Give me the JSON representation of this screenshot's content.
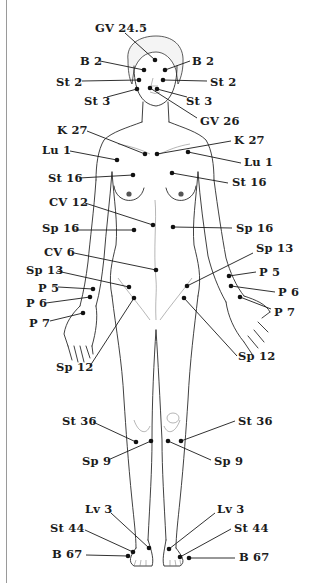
{
  "diagram": {
    "type": "acupressure-points-front-body",
    "ink_color": "#1c1c1c",
    "background": "#ffffff",
    "points": [
      {
        "id": "gv24_5",
        "label": "GV 24.5",
        "lx": 95,
        "ly": 22,
        "dot": [
          155,
          60
        ],
        "line_from": [
          125,
          33
        ]
      },
      {
        "id": "b2_l",
        "label": "B 2",
        "lx": 80,
        "ly": 55,
        "dot": [
          144,
          70
        ],
        "line_from": [
          100,
          61
        ]
      },
      {
        "id": "b2_r",
        "label": "B 2",
        "lx": 192,
        "ly": 55,
        "dot": [
          165,
          70
        ],
        "line_from": [
          190,
          61
        ]
      },
      {
        "id": "st2_l",
        "label": "St 2",
        "lx": 56,
        "ly": 76,
        "dot": [
          139,
          80
        ],
        "line_from": [
          82,
          81
        ]
      },
      {
        "id": "st2_r",
        "label": "St 2",
        "lx": 210,
        "ly": 76,
        "dot": [
          163,
          80
        ],
        "line_from": [
          207,
          81
        ]
      },
      {
        "id": "st3_l",
        "label": "St 3",
        "lx": 84,
        "ly": 95,
        "dot": [
          137,
          89
        ],
        "line_from": [
          107,
          97
        ]
      },
      {
        "id": "st3_r",
        "label": "St 3",
        "lx": 186,
        "ly": 95,
        "dot": [
          157,
          89
        ],
        "line_from": [
          187,
          97
        ]
      },
      {
        "id": "gv26",
        "label": "GV 26",
        "lx": 200,
        "ly": 115,
        "dot": [
          150,
          88
        ],
        "line_from": [
          197,
          118
        ]
      },
      {
        "id": "k27_l",
        "label": "K 27",
        "lx": 57,
        "ly": 124,
        "dot": [
          145,
          154
        ],
        "line_from": [
          87,
          131
        ]
      },
      {
        "id": "k27_r",
        "label": "K 27",
        "lx": 234,
        "ly": 134,
        "dot": [
          157,
          154
        ],
        "line_from": [
          231,
          141
        ]
      },
      {
        "id": "lu1_l",
        "label": "Lu 1",
        "lx": 42,
        "ly": 144,
        "dot": [
          117,
          160
        ],
        "line_from": [
          70,
          151
        ]
      },
      {
        "id": "lu1_r",
        "label": "Lu 1",
        "lx": 244,
        "ly": 156,
        "dot": [
          188,
          152
        ],
        "line_from": [
          241,
          163
        ]
      },
      {
        "id": "st16_l",
        "label": "St 16",
        "lx": 48,
        "ly": 172,
        "dot": [
          133,
          175
        ],
        "line_from": [
          79,
          178
        ]
      },
      {
        "id": "st16_r",
        "label": "St 16",
        "lx": 232,
        "ly": 176,
        "dot": [
          172,
          173
        ],
        "line_from": [
          228,
          183
        ]
      },
      {
        "id": "cv12",
        "label": "CV 12",
        "lx": 49,
        "ly": 196,
        "dot": [
          153,
          225
        ],
        "line_from": [
          85,
          203
        ]
      },
      {
        "id": "sp16_l",
        "label": "Sp 16",
        "lx": 42,
        "ly": 222,
        "dot": [
          134,
          230
        ],
        "line_from": [
          73,
          230
        ]
      },
      {
        "id": "sp16_r",
        "label": "Sp 16",
        "lx": 236,
        "ly": 222,
        "dot": [
          173,
          227
        ],
        "line_from": [
          232,
          228
        ]
      },
      {
        "id": "cv6",
        "label": "CV 6",
        "lx": 44,
        "ly": 246,
        "dot": [
          156,
          270
        ],
        "line_from": [
          74,
          253
        ]
      },
      {
        "id": "sp13_l",
        "label": "Sp 13",
        "lx": 26,
        "ly": 264,
        "dot": [
          129,
          287
        ],
        "line_from": [
          57,
          271
        ]
      },
      {
        "id": "sp13_r",
        "label": "Sp 13",
        "lx": 256,
        "ly": 242,
        "dot": [
          187,
          286
        ],
        "line_from": [
          253,
          253
        ]
      },
      {
        "id": "p5_l",
        "label": "P 5",
        "lx": 38,
        "ly": 282,
        "dot": [
          93,
          289
        ],
        "line_from": [
          58,
          287
        ]
      },
      {
        "id": "p5_r",
        "label": "P 5",
        "lx": 259,
        "ly": 266,
        "dot": [
          229,
          276
        ],
        "line_from": [
          256,
          272
        ]
      },
      {
        "id": "p6_l",
        "label": "P 6",
        "lx": 26,
        "ly": 297,
        "dot": [
          90,
          297
        ],
        "line_from": [
          46,
          303
        ]
      },
      {
        "id": "p6_r",
        "label": "P 6",
        "lx": 278,
        "ly": 286,
        "dot": [
          231,
          286
        ],
        "line_from": [
          275,
          292
        ]
      },
      {
        "id": "p7_l",
        "label": "P 7",
        "lx": 29,
        "ly": 317,
        "dot": [
          83,
          313
        ],
        "line_from": [
          50,
          321
        ]
      },
      {
        "id": "p7_r",
        "label": "P 7",
        "lx": 274,
        "ly": 306,
        "dot": [
          240,
          297
        ],
        "line_from": [
          271,
          309
        ]
      },
      {
        "id": "sp12_l",
        "label": "Sp 12",
        "lx": 56,
        "ly": 361,
        "dot": [
          134,
          298
        ],
        "line_from": [
          90,
          366
        ]
      },
      {
        "id": "sp12_r",
        "label": "Sp 12",
        "lx": 238,
        "ly": 350,
        "dot": [
          184,
          298
        ],
        "line_from": [
          237,
          356
        ]
      },
      {
        "id": "st36_l",
        "label": "St 36",
        "lx": 62,
        "ly": 415,
        "dot": [
          136,
          442
        ],
        "line_from": [
          93,
          422
        ]
      },
      {
        "id": "st36_r",
        "label": "St 36",
        "lx": 238,
        "ly": 415,
        "dot": [
          181,
          441
        ],
        "line_from": [
          235,
          421
        ]
      },
      {
        "id": "sp9_l",
        "label": "Sp 9",
        "lx": 82,
        "ly": 455,
        "dot": [
          151,
          441
        ],
        "line_from": [
          108,
          460
        ]
      },
      {
        "id": "sp9_r",
        "label": "Sp 9",
        "lx": 214,
        "ly": 455,
        "dot": [
          168,
          441
        ],
        "line_from": [
          211,
          460
        ]
      },
      {
        "id": "lv3_l",
        "label": "Lv 3",
        "lx": 85,
        "ly": 503,
        "dot": [
          149,
          548
        ],
        "line_from": [
          111,
          513
        ]
      },
      {
        "id": "lv3_r",
        "label": "Lv 3",
        "lx": 217,
        "ly": 503,
        "dot": [
          169,
          549
        ],
        "line_from": [
          215,
          513
        ]
      },
      {
        "id": "st44_l",
        "label": "St 44",
        "lx": 50,
        "ly": 522,
        "dot": [
          133,
          552
        ],
        "line_from": [
          85,
          530
        ]
      },
      {
        "id": "st44_r",
        "label": "St 44",
        "lx": 234,
        "ly": 522,
        "dot": [
          180,
          557
        ],
        "line_from": [
          231,
          529
        ]
      },
      {
        "id": "b67_l",
        "label": "B 67",
        "lx": 52,
        "ly": 548,
        "dot": [
          128,
          556
        ],
        "line_from": [
          86,
          555
        ]
      },
      {
        "id": "b67_r",
        "label": "B 67",
        "lx": 239,
        "ly": 551,
        "dot": [
          189,
          558
        ],
        "line_from": [
          235,
          558
        ]
      }
    ]
  }
}
